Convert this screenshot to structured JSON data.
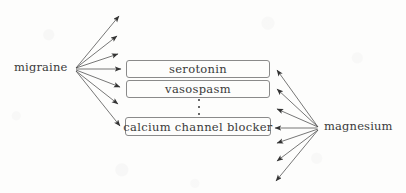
{
  "diagram": {
    "background_color": "#fdfdfc",
    "stroke_color": "#3a3a3a",
    "box_border_color": "#8a8a8a",
    "nodes": {
      "source": {
        "label": "migraine",
        "x": 75,
        "y": 69
      },
      "target": {
        "label": "magnesium",
        "x": 320,
        "y": 128
      }
    },
    "boxes": [
      {
        "label": "serotonin"
      },
      {
        "label": "vasospasm"
      },
      {
        "label": "calcium channel blocker"
      }
    ],
    "ellipsis_symbol": "vertical-ellipsis-dots",
    "edges": {
      "from_source_count": 7,
      "to_target_count": 7,
      "arrowhead": "filled-triangle"
    }
  }
}
